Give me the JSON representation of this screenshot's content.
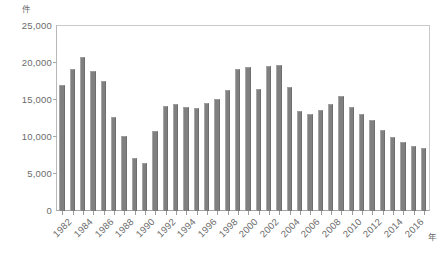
{
  "chart_data": {
    "type": "bar",
    "title": "",
    "subtitle": "",
    "xlabel": "年",
    "ylabel": "件",
    "ylim": [
      0,
      25000
    ],
    "ytick_labels": [
      "0",
      "5,000",
      "10,000",
      "15,000",
      "20,000",
      "25,000"
    ],
    "ytick_values": [
      0,
      5000,
      10000,
      15000,
      20000,
      25000
    ],
    "grid": false,
    "legend": "none",
    "bar_color": "#808080",
    "categories": [
      "1982",
      "1983",
      "1984",
      "1985",
      "1986",
      "1987",
      "1988",
      "1989",
      "1990",
      "1991",
      "1992",
      "1993",
      "1994",
      "1995",
      "1996",
      "1997",
      "1998",
      "1999",
      "2000",
      "2001",
      "2002",
      "2003",
      "2004",
      "2005",
      "2006",
      "2007",
      "2008",
      "2009",
      "2010",
      "2011",
      "2012",
      "2013",
      "2014",
      "2015",
      "2016",
      "2017"
    ],
    "xtick_labels_shown": [
      "1982",
      "1984",
      "1986",
      "1988",
      "1990",
      "1992",
      "1994",
      "1996",
      "1998",
      "2000",
      "2002",
      "2004",
      "2006",
      "2008",
      "2010",
      "2012",
      "2014",
      "2016"
    ],
    "values": [
      17000,
      19200,
      20800,
      18900,
      17600,
      12700,
      10100,
      7200,
      6500,
      10800,
      14200,
      14400,
      14000,
      13900,
      14600,
      15100,
      16300,
      19200,
      19400,
      16500,
      19600,
      19700,
      16800,
      13500,
      13100,
      13600,
      14400,
      15600,
      14000,
      13100,
      12300,
      11000,
      10000,
      9300,
      8800,
      8500
    ]
  }
}
